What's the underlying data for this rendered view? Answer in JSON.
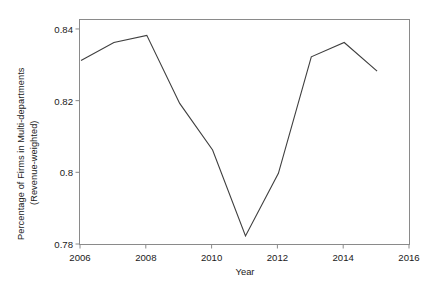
{
  "chart_data": {
    "type": "line",
    "title": "",
    "subtitle": "",
    "xlabel": "Year",
    "ylabel": "Percentage of Firms in Multi-departments (Revenue-weighted)",
    "ylabel_lines": [
      "Percentage of Firms in Multi-departments",
      "(Revenue-weighted)"
    ],
    "x": [
      2006,
      2007,
      2008,
      2009,
      2010,
      2011,
      2012,
      2013,
      2014,
      2015
    ],
    "values": [
      0.8315,
      0.8365,
      0.8385,
      0.8195,
      0.8065,
      0.7825,
      0.8,
      0.8325,
      0.8365,
      0.8285
    ],
    "series": [
      {
        "name": "Percentage of Firms in Multi-departments (Revenue-weighted)",
        "values": [
          0.8315,
          0.8365,
          0.8385,
          0.8195,
          0.8065,
          0.7825,
          0.8,
          0.8325,
          0.8365,
          0.8285
        ]
      }
    ],
    "xlim": [
      2006,
      2016
    ],
    "ylim": [
      0.78,
      0.8425
    ],
    "xticks": [
      2006,
      2008,
      2010,
      2012,
      2014,
      2016
    ],
    "xtick_labels": [
      "2006",
      "2008",
      "2010",
      "2012",
      "2014",
      "2016"
    ],
    "yticks": [
      0.78,
      0.8,
      0.82,
      0.84
    ],
    "ytick_labels": [
      "0.78",
      "0.8",
      "0.82",
      "0.84"
    ],
    "grid": false,
    "legend": false,
    "legend_position": "none",
    "line_color": "#3f3f3f",
    "panel_border_color": "#8a8a8a",
    "background_color": "#ffffff",
    "markers": false
  }
}
